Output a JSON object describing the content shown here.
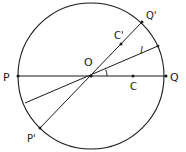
{
  "diagram": {
    "circle": {
      "cx": 91,
      "cy": 76,
      "r": 73
    },
    "color": "#1a1a1a",
    "points": {
      "O": {
        "label": "O",
        "x": 91,
        "y": 76,
        "lx": 84,
        "ly": 66
      },
      "P": {
        "label": "P",
        "x": 18,
        "y": 76,
        "lx": 3,
        "ly": 81
      },
      "Q": {
        "label": "Q",
        "x": 166,
        "y": 76,
        "lx": 170,
        "ly": 81
      },
      "C": {
        "label": "C",
        "x": 133,
        "y": 76,
        "lx": 130,
        "ly": 90
      },
      "Qp": {
        "label": "Q'",
        "x": 142,
        "y": 22,
        "lx": 146,
        "ly": 19
      },
      "Pp": {
        "label": "P'",
        "x": 40,
        "y": 128,
        "lx": 27,
        "ly": 142
      },
      "Cp": {
        "label": "C'",
        "x": 121,
        "y": 44,
        "lx": 114,
        "ly": 39
      },
      "l": {
        "label": "l",
        "x": 158,
        "y": 46,
        "lx": 140,
        "ly": 54
      },
      "l2": {
        "label": "",
        "x": 25,
        "y": 103
      }
    },
    "angle_marker": {
      "label": "angle between PQ and l"
    }
  }
}
